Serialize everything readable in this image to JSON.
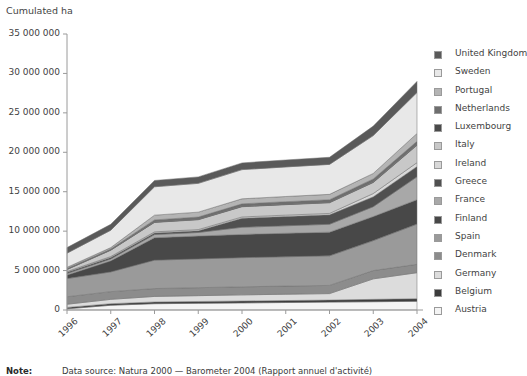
{
  "axis_title": "Cumulated ha",
  "note": {
    "label": "Note:",
    "text": "Data source: Natura 2000 — Barometer 2004 (Rapport annuel d'activité)"
  },
  "legend": {
    "position": "right",
    "items": [
      {
        "label": "United Kingdom",
        "color": "#5a5a5a"
      },
      {
        "label": "Sweden",
        "color": "#e8e8e8"
      },
      {
        "label": "Portugal",
        "color": "#b4b4b4"
      },
      {
        "label": "Netherlands",
        "color": "#6e6e6e"
      },
      {
        "label": "Luxembourg",
        "color": "#4a4a4a"
      },
      {
        "label": "Italy",
        "color": "#c8c8c8"
      },
      {
        "label": "Ireland",
        "color": "#d8d8d8"
      },
      {
        "label": "Greece",
        "color": "#505050"
      },
      {
        "label": "France",
        "color": "#a8a8a8"
      },
      {
        "label": "Finland",
        "color": "#484848"
      },
      {
        "label": "Spain",
        "color": "#9a9a9a"
      },
      {
        "label": "Denmark",
        "color": "#8c8c8c"
      },
      {
        "label": "Germany",
        "color": "#dcdcdc"
      },
      {
        "label": "Belgium",
        "color": "#3c3c3c"
      },
      {
        "label": "Austria",
        "color": "#f4f4f4"
      }
    ]
  },
  "chart_data": {
    "type": "area",
    "stacked": true,
    "title": "",
    "subtitle": "",
    "xlabel": "",
    "ylabel": "Cumulated ha",
    "ylim": [
      0,
      35000000
    ],
    "ytick_labels": [
      "35 000 000",
      "30 000 000",
      "25 000 000",
      "20 000 000",
      "15 000 000",
      "10 000 000",
      "5 000 000",
      "0"
    ],
    "ytick_values": [
      35000000,
      30000000,
      25000000,
      20000000,
      15000000,
      10000000,
      5000000,
      0
    ],
    "grid": false,
    "legend_position": "right",
    "categories": [
      "1996",
      "1997",
      "1998",
      "1999",
      "2000",
      "2001",
      "2002",
      "2003",
      "2004"
    ],
    "series": [
      {
        "name": "Austria",
        "color": "#f4f4f4",
        "values": [
          150000,
          600000,
          800000,
          850000,
          900000,
          950000,
          1000000,
          1050000,
          1100000
        ]
      },
      {
        "name": "Belgium",
        "color": "#3c3c3c",
        "values": [
          180000,
          200000,
          220000,
          230000,
          240000,
          250000,
          260000,
          300000,
          330000
        ]
      },
      {
        "name": "Germany",
        "color": "#dcdcdc",
        "values": [
          400000,
          550000,
          700000,
          740000,
          780000,
          800000,
          820000,
          2600000,
          3300000
        ]
      },
      {
        "name": "Denmark",
        "color": "#8c8c8c",
        "values": [
          950000,
          980000,
          1000000,
          1010000,
          1020000,
          1030000,
          1040000,
          1050000,
          1060000
        ]
      },
      {
        "name": "Spain",
        "color": "#9a9a9a",
        "values": [
          2300000,
          2500000,
          3600000,
          3650000,
          3700000,
          3720000,
          3750000,
          3800000,
          5100000
        ]
      },
      {
        "name": "Finland",
        "color": "#484848",
        "values": [
          450000,
          1400000,
          2850000,
          2900000,
          2950000,
          2980000,
          3000000,
          3050000,
          3100000
        ]
      },
      {
        "name": "France",
        "color": "#a8a8a8",
        "values": [
          200000,
          250000,
          400000,
          450000,
          900000,
          950000,
          1000000,
          1250000,
          2900000
        ]
      },
      {
        "name": "Greece",
        "color": "#505050",
        "values": [
          150000,
          180000,
          200000,
          220000,
          1150000,
          1180000,
          1200000,
          1250000,
          1300000
        ]
      },
      {
        "name": "Ireland",
        "color": "#d8d8d8",
        "values": [
          100000,
          120000,
          140000,
          150000,
          160000,
          170000,
          180000,
          420000,
          500000
        ]
      },
      {
        "name": "Italy",
        "color": "#c8c8c8",
        "values": [
          250000,
          800000,
          1200000,
          1250000,
          1300000,
          1330000,
          1350000,
          1400000,
          2200000
        ]
      },
      {
        "name": "Luxembourg",
        "color": "#4a4a4a",
        "values": [
          30000,
          35000,
          38000,
          40000,
          42000,
          44000,
          46000,
          48000,
          50000
        ]
      },
      {
        "name": "Netherlands",
        "color": "#6e6e6e",
        "values": [
          100000,
          120000,
          280000,
          300000,
          320000,
          330000,
          340000,
          400000,
          450000
        ]
      },
      {
        "name": "Portugal",
        "color": "#b4b4b4",
        "values": [
          150000,
          180000,
          600000,
          620000,
          640000,
          660000,
          680000,
          700000,
          1000000
        ]
      },
      {
        "name": "Sweden",
        "color": "#e8e8e8",
        "values": [
          1800000,
          2200000,
          3600000,
          3650000,
          3700000,
          3750000,
          3800000,
          4800000,
          5200000
        ]
      },
      {
        "name": "United Kingdom",
        "color": "#5a5a5a",
        "values": [
          700000,
          750000,
          800000,
          820000,
          850000,
          880000,
          900000,
          1200000,
          1400000
        ]
      }
    ]
  }
}
